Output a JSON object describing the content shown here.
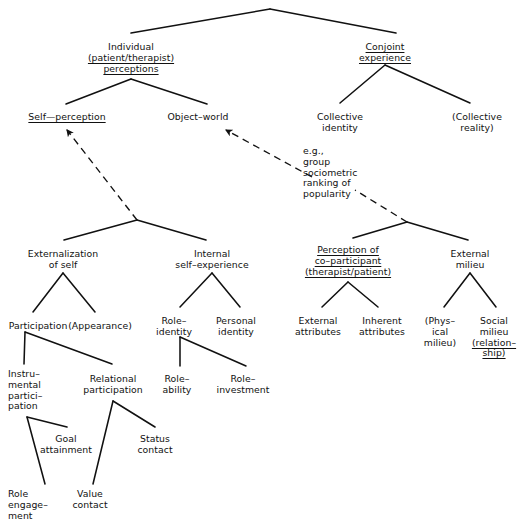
{
  "figure": {
    "type": "hierarchical-tree-diagram",
    "title": "",
    "background_color": "#ffffff",
    "line_color": "#111111",
    "width": 529,
    "height": 532
  },
  "nodes": [
    {
      "id": "root",
      "x": 270,
      "y": 10,
      "lines": [],
      "underline": []
    },
    {
      "id": "individual",
      "x": 131,
      "y": 42,
      "lines": [
        "Individual",
        "(patient/therapist)",
        "perceptions"
      ],
      "underline": [
        false,
        true,
        true
      ]
    },
    {
      "id": "conjoint",
      "x": 385,
      "y": 42,
      "lines": [
        "Conjoint",
        "experience"
      ],
      "underline": [
        true,
        true
      ]
    },
    {
      "id": "self-perception",
      "x": 67,
      "y": 112,
      "lines": [
        "Self—perception"
      ],
      "underline": [
        true
      ]
    },
    {
      "id": "object-world",
      "x": 198,
      "y": 112,
      "lines": [
        "Object–world"
      ],
      "underline": [
        false
      ]
    },
    {
      "id": "collective-identity",
      "x": 340,
      "y": 112,
      "lines": [
        "Collective",
        "identity"
      ],
      "underline": [
        false,
        false
      ]
    },
    {
      "id": "collective-reality",
      "x": 477,
      "y": 112,
      "lines": [
        "(Collective",
        "reality)"
      ],
      "underline": [
        false,
        false
      ]
    },
    {
      "id": "eg-note",
      "x": 303,
      "y": 146,
      "lines": [
        "e.g.,",
        "group",
        "sociometric",
        "ranking of",
        "popularity"
      ],
      "underline": [
        false,
        false,
        false,
        false,
        false
      ],
      "align": "left"
    },
    {
      "id": "externalization",
      "x": 63,
      "y": 249,
      "lines": [
        "Externalization",
        "of self"
      ],
      "underline": [
        false,
        false
      ]
    },
    {
      "id": "internal-self",
      "x": 212,
      "y": 249,
      "lines": [
        "Internal",
        "self–experience"
      ],
      "underline": [
        false,
        false
      ]
    },
    {
      "id": "perception-coparticipant",
      "x": 348,
      "y": 245,
      "lines": [
        "Perception of",
        "co–participant",
        "(therapist/patient)"
      ],
      "underline": [
        true,
        true,
        true
      ]
    },
    {
      "id": "external-milieu",
      "x": 470,
      "y": 249,
      "lines": [
        "External",
        "milieu"
      ],
      "underline": [
        false,
        false
      ]
    },
    {
      "id": "participation",
      "x": 38,
      "y": 321,
      "lines": [
        "Participation"
      ],
      "underline": [
        false
      ]
    },
    {
      "id": "appearance",
      "x": 100,
      "y": 321,
      "lines": [
        "(Appearance)"
      ],
      "underline": [
        false
      ]
    },
    {
      "id": "role-identity",
      "x": 174,
      "y": 316,
      "lines": [
        "Role–",
        "identity"
      ],
      "underline": [
        false,
        false
      ]
    },
    {
      "id": "personal-identity",
      "x": 236,
      "y": 316,
      "lines": [
        "Personal",
        "identity"
      ],
      "underline": [
        false,
        false
      ]
    },
    {
      "id": "external-attributes",
      "x": 318,
      "y": 316,
      "lines": [
        "External",
        "attributes"
      ],
      "underline": [
        false,
        false
      ]
    },
    {
      "id": "inherent-attributes",
      "x": 382,
      "y": 316,
      "lines": [
        "Inherent",
        "attributes"
      ],
      "underline": [
        false,
        false
      ]
    },
    {
      "id": "physical-milieu",
      "x": 440,
      "y": 316,
      "lines": [
        "(Phys–",
        "ical",
        "milieu)"
      ],
      "underline": [
        false,
        false,
        false
      ]
    },
    {
      "id": "social-milieu",
      "x": 494,
      "y": 316,
      "lines": [
        "Social",
        "milieu",
        "(relation–",
        "ship)"
      ],
      "underline": [
        false,
        false,
        true,
        true
      ]
    },
    {
      "id": "instrumental",
      "x": 8,
      "y": 369,
      "lines": [
        "Instru–",
        "mental",
        "partici–",
        "pation"
      ],
      "underline": [
        false,
        false,
        false,
        false
      ],
      "align": "left"
    },
    {
      "id": "relational",
      "x": 113,
      "y": 374,
      "lines": [
        "Relational",
        "participation"
      ],
      "underline": [
        false,
        false
      ]
    },
    {
      "id": "role-ability",
      "x": 177,
      "y": 374,
      "lines": [
        "Role–",
        "ability"
      ],
      "underline": [
        false,
        false
      ]
    },
    {
      "id": "role-investment",
      "x": 243,
      "y": 374,
      "lines": [
        "Role–",
        "investment"
      ],
      "underline": [
        false,
        false
      ]
    },
    {
      "id": "goal-attainment",
      "x": 66,
      "y": 434,
      "lines": [
        "Goal",
        "attainment"
      ],
      "underline": [
        false,
        false
      ]
    },
    {
      "id": "status-contact",
      "x": 155,
      "y": 434,
      "lines": [
        "Status",
        "contact"
      ],
      "underline": [
        false,
        false
      ]
    },
    {
      "id": "role-engagement",
      "x": 8,
      "y": 489,
      "lines": [
        "Role",
        "engage–",
        "ment"
      ],
      "underline": [
        false,
        false,
        false
      ],
      "align": "left"
    },
    {
      "id": "value-contact",
      "x": 90,
      "y": 489,
      "lines": [
        "Value",
        "contact"
      ],
      "underline": [
        false,
        false
      ]
    }
  ],
  "edges": [
    {
      "from": "root",
      "to": "individual",
      "d": "M 270 9 L 131 33"
    },
    {
      "from": "root",
      "to": "conjoint",
      "d": "M 270 9 L 396 33"
    },
    {
      "from": "individual",
      "to": "self-perception",
      "d": "M 131 79 L 66 104"
    },
    {
      "from": "individual",
      "to": "object-world",
      "d": "M 131 79 L 207 104"
    },
    {
      "from": "conjoint",
      "to": "collective-identity",
      "d": "M 385 65 L 340 103"
    },
    {
      "from": "conjoint",
      "to": "collective-reality",
      "d": "M 385 65 L 470 103"
    },
    {
      "from": "externalization-apex",
      "to": "externalization",
      "d": "M 137 220 L 64 240"
    },
    {
      "from": "externalization-apex",
      "to": "internal-self",
      "d": "M 137 220 L 206 240"
    },
    {
      "from": "coparticipant-apex",
      "to": "perception-coparticipant",
      "d": "M 407 222 L 353 238"
    },
    {
      "from": "coparticipant-apex",
      "to": "external-milieu",
      "d": "M 407 222 L 468 240"
    },
    {
      "from": "externalization",
      "to": "participation",
      "d": "M 63 273 L 33 312"
    },
    {
      "from": "externalization",
      "to": "appearance",
      "d": "M 63 273 L 95 312"
    },
    {
      "from": "internal-self",
      "to": "role-identity",
      "d": "M 212 273 L 180 307"
    },
    {
      "from": "internal-self",
      "to": "personal-identity",
      "d": "M 212 273 L 240 307"
    },
    {
      "from": "perception-coparticipant",
      "to": "external-attributes",
      "d": "M 348 282 L 322 307"
    },
    {
      "from": "perception-coparticipant",
      "to": "inherent-attributes",
      "d": "M 348 282 L 378 307"
    },
    {
      "from": "external-milieu",
      "to": "physical-milieu",
      "d": "M 470 273 L 444 307"
    },
    {
      "from": "external-milieu",
      "to": "social-milieu",
      "d": "M 470 273 L 496 307"
    },
    {
      "from": "participation",
      "to": "instrumental",
      "d": "M 25 332 L 24 364"
    },
    {
      "from": "participation",
      "to": "relational",
      "d": "M 25 332 L 112 364"
    },
    {
      "from": "role-identity",
      "to": "role-ability",
      "d": "M 180 337 L 180 366"
    },
    {
      "from": "role-identity",
      "to": "role-investment",
      "d": "M 180 337 L 246 366"
    },
    {
      "from": "instrumental",
      "to": "role-engagement",
      "d": "M 27 417 L 45 484"
    },
    {
      "from": "instrumental",
      "to": "goal-attainment",
      "d": "M 27 417 L 67 427"
    },
    {
      "from": "relational",
      "to": "value-contact",
      "d": "M 113 401 L 93 484"
    },
    {
      "from": "relational",
      "to": "status-contact",
      "d": "M 113 401 L 155 427"
    }
  ],
  "dashed_arrows": [
    {
      "id": "arrow-to-self-perception",
      "from": "externalization-apex",
      "to": "self-perception",
      "d": "M 137 220 L 67 130",
      "arrowhead": true
    },
    {
      "id": "arrow-to-object-world-seg1",
      "from": "coparticipant-apex",
      "to": "eg-note",
      "d": "M 407 222 L 355 190",
      "arrowhead": false
    },
    {
      "id": "arrow-to-object-world-seg2",
      "from": "eg-note",
      "to": "object-world",
      "d": "M 312 177 L 226 130",
      "arrowhead": true
    }
  ],
  "caption": "",
  "legend": {
    "solid_line": "hierarchical branch",
    "dashed_arrow": "relates to"
  }
}
